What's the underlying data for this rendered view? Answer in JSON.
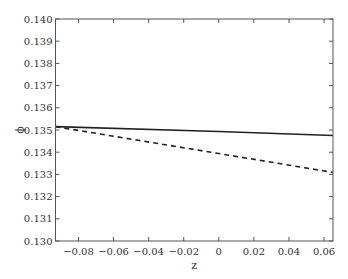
{
  "chart_data": {
    "type": "line",
    "title": "",
    "xlabel": "z",
    "ylabel": "ϕ",
    "xlim": [
      -0.0931,
      0.0651
    ],
    "ylim": [
      0.13,
      0.14
    ],
    "xticks": [
      -0.08,
      -0.06,
      -0.04,
      -0.02,
      0,
      0.02,
      0.04,
      0.06
    ],
    "xtick_labels": [
      "−0.08",
      "−0.06",
      "−0.04",
      "−0.02",
      "0",
      "0.02",
      "0.04",
      "0.06"
    ],
    "yticks": [
      0.13,
      0.131,
      0.132,
      0.133,
      0.134,
      0.135,
      0.136,
      0.137,
      0.138,
      0.139,
      0.14
    ],
    "ytick_labels": [
      "0.130",
      "0.131",
      "0.132",
      "0.133",
      "0.134",
      "0.135",
      "0.136",
      "0.137",
      "0.138",
      "0.139",
      "0.140"
    ],
    "grid": false,
    "legend": null,
    "series": [
      {
        "name": "solid",
        "style": "solid",
        "color": "#222222",
        "x": [
          -0.0931,
          0.0,
          0.0651
        ],
        "y": [
          0.13515,
          0.13493,
          0.13475
        ]
      },
      {
        "name": "dashed",
        "style": "dashed",
        "color": "#222222",
        "x": [
          -0.0931,
          0.0,
          0.0651
        ],
        "y": [
          0.13515,
          0.13394,
          0.13309
        ]
      }
    ]
  },
  "layout": {
    "plot_left": 55.5,
    "plot_right": 333,
    "plot_top": 19,
    "plot_bottom": 241,
    "frame_color": "#555555"
  }
}
